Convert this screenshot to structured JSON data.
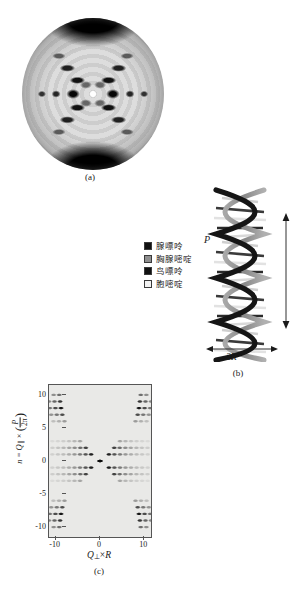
{
  "figure": {
    "panels": [
      {
        "id": "a",
        "caption": "(a)",
        "description": "X-ray fiber diffraction photograph of DNA (Photo 51)"
      },
      {
        "id": "b",
        "caption": "(b)",
        "description": "DNA double helix model"
      },
      {
        "id": "c",
        "caption": "(c)",
        "description": "Simulated helix diffraction intensity map"
      }
    ]
  },
  "legend": {
    "items": [
      {
        "label": "腺嘌呤",
        "swatch": "base-adenine-swatch",
        "color": "#111111"
      },
      {
        "label": "胸腺嘧啶",
        "swatch": "base-thymine-swatch",
        "color": "#8f8f8f"
      },
      {
        "label": "鸟嘌呤",
        "swatch": "base-guanine-swatch",
        "color": "#111111"
      },
      {
        "label": "胞嘧啶",
        "swatch": "base-cytosine-swatch",
        "color": "#f2f2f2"
      }
    ]
  },
  "helix": {
    "pitch_label": "P",
    "diameter_label": "2R",
    "strand_color_dark": "#151515",
    "strand_color_light": "#9a9a9a"
  },
  "chart_data": {
    "type": "heatmap",
    "title": "",
    "xlabel": "Q⊥ × R",
    "ylabel": "n = Q∥ × (P/2π)",
    "ylabel_parts": {
      "prefix": "n = Q",
      "sub1": "∥",
      "times": " × ",
      "num": "P",
      "den": "2π"
    },
    "xlabel_parts": {
      "symbol": "Q",
      "sub": "⊥",
      "times": " × ",
      "radius": "R"
    },
    "xlim": [
      -11.5,
      11.5
    ],
    "ylim": [
      -11.5,
      11.5
    ],
    "xticks": [
      -10,
      0,
      10
    ],
    "xtick_labels": [
      "-10",
      "0",
      "10"
    ],
    "yticks": [
      -10,
      -5,
      0,
      5,
      10
    ],
    "ytick_labels": [
      "10",
      "5",
      "0",
      "-5",
      "-10"
    ],
    "grid": false,
    "legend_position": "none",
    "colormap": "grayscale-inverted",
    "layer_lines": [
      {
        "n": 10,
        "intensity": 0.55,
        "peak_x": [
          -9.2,
          9.2
        ]
      },
      {
        "n": 9,
        "intensity": 0.8,
        "peak_x": [
          -9.0,
          9.0
        ]
      },
      {
        "n": 8,
        "intensity": 0.95,
        "peak_x": [
          -8.8,
          8.8
        ]
      },
      {
        "n": 7,
        "intensity": 0.7,
        "peak_x": [
          -8.5,
          8.5
        ]
      },
      {
        "n": 6,
        "intensity": 0.35,
        "peak_x": [
          -8.0,
          8.0
        ]
      },
      {
        "n": 3,
        "intensity": 0.3,
        "peak_x": [
          -4.5,
          4.5
        ]
      },
      {
        "n": 2,
        "intensity": 0.75,
        "peak_x": [
          -3.2,
          3.2
        ]
      },
      {
        "n": 1,
        "intensity": 0.9,
        "peak_x": [
          -2.0,
          2.0
        ]
      },
      {
        "n": 0,
        "intensity": 1.0,
        "peak_x": [
          0
        ]
      },
      {
        "n": -1,
        "intensity": 0.9,
        "peak_x": [
          -2.0,
          2.0
        ]
      },
      {
        "n": -2,
        "intensity": 0.75,
        "peak_x": [
          -3.2,
          3.2
        ]
      },
      {
        "n": -3,
        "intensity": 0.3,
        "peak_x": [
          -4.5,
          4.5
        ]
      },
      {
        "n": -6,
        "intensity": 0.35,
        "peak_x": [
          -8.0,
          8.0
        ]
      },
      {
        "n": -7,
        "intensity": 0.7,
        "peak_x": [
          -8.5,
          8.5
        ]
      },
      {
        "n": -8,
        "intensity": 0.95,
        "peak_x": [
          -8.8,
          8.8
        ]
      },
      {
        "n": -9,
        "intensity": 0.8,
        "peak_x": [
          -9.0,
          9.0
        ]
      },
      {
        "n": -10,
        "intensity": 0.55,
        "peak_x": [
          -9.2,
          9.2
        ]
      }
    ]
  }
}
